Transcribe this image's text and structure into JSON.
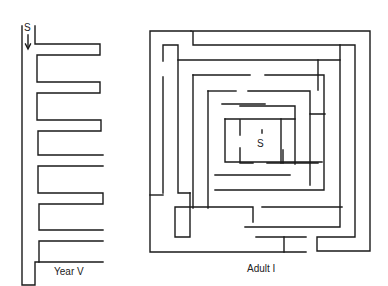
{
  "mazes": [
    {
      "label": "Year V",
      "start_marker": "S"
    },
    {
      "label": "Adult I",
      "start_marker": "S"
    }
  ],
  "colors": {
    "line": "#1a1a1a",
    "background": "#ffffff"
  }
}
